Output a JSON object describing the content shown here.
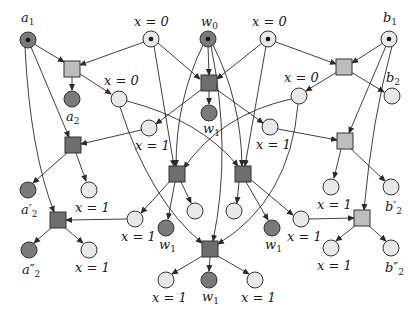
{
  "diagram": {
    "type": "petri-net",
    "colors": {
      "place_dark": "#7a7a7a",
      "place_light": "#e8e8e8",
      "trans_dark": "#6e6e6e",
      "trans_light": "#bdbdbd",
      "token": "#111111",
      "edge": "#2a2a2a"
    },
    "places": [
      {
        "id": "p_a1",
        "x": 28,
        "y": 40,
        "fill": "dark",
        "token": true,
        "label": "a",
        "sub": "1",
        "lx": 21,
        "ly": 22
      },
      {
        "id": "p_x0_top_l",
        "x": 151,
        "y": 39,
        "fill": "light",
        "token": true,
        "label": "x = 0",
        "sub": "",
        "lx": 134,
        "ly": 26
      },
      {
        "id": "p_w0",
        "x": 208,
        "y": 39,
        "fill": "dark",
        "token": true,
        "label": "w",
        "sub": "0",
        "lx": 201,
        "ly": 26
      },
      {
        "id": "p_x0_top_r",
        "x": 268,
        "y": 39,
        "fill": "light",
        "token": true,
        "label": "x = 0",
        "sub": "",
        "lx": 252,
        "ly": 26
      },
      {
        "id": "p_b1",
        "x": 389,
        "y": 39,
        "fill": "light",
        "token": true,
        "label": "b",
        "sub": "1",
        "lx": 383,
        "ly": 22
      },
      {
        "id": "p_a2",
        "x": 72,
        "y": 99,
        "fill": "dark",
        "token": false,
        "label": "a",
        "sub": "2",
        "lx": 66,
        "ly": 121
      },
      {
        "id": "p_x0_mid_l",
        "x": 119,
        "y": 99,
        "fill": "light",
        "token": false,
        "label": "x = 0",
        "sub": "",
        "lx": 104,
        "ly": 85
      },
      {
        "id": "p_w1_top",
        "x": 209,
        "y": 113,
        "fill": "dark",
        "token": false,
        "label": "w",
        "sub": "1",
        "lx": 203,
        "ly": 133
      },
      {
        "id": "p_x0_mid_r",
        "x": 299,
        "y": 96,
        "fill": "light",
        "token": false,
        "label": "x = 0",
        "sub": "",
        "lx": 284,
        "ly": 82
      },
      {
        "id": "p_b2",
        "x": 392,
        "y": 96,
        "fill": "light",
        "token": false,
        "label": "b",
        "sub": "2",
        "lx": 386,
        "ly": 82
      },
      {
        "id": "p_x1_l1",
        "x": 149,
        "y": 128,
        "fill": "light",
        "token": false,
        "label": "x = 1",
        "sub": "",
        "lx": 135,
        "ly": 150
      },
      {
        "id": "p_x1_r1",
        "x": 270,
        "y": 127,
        "fill": "light",
        "token": false,
        "label": "x = 1",
        "sub": "",
        "lx": 256,
        "ly": 149
      },
      {
        "id": "p_a2p",
        "x": 28,
        "y": 190,
        "fill": "dark",
        "token": false,
        "label": "a′",
        "sub": "2",
        "lx": 21,
        "ly": 214
      },
      {
        "id": "p_x1_l2",
        "x": 89,
        "y": 190,
        "fill": "light",
        "token": false,
        "label": "x = 1",
        "sub": "",
        "lx": 75,
        "ly": 212
      },
      {
        "id": "p_x1_r2",
        "x": 331,
        "y": 187,
        "fill": "light",
        "token": false,
        "label": "x = 1",
        "sub": "",
        "lx": 317,
        "ly": 209
      },
      {
        "id": "p_b2p",
        "x": 391,
        "y": 187,
        "fill": "light",
        "token": false,
        "label": "b′",
        "sub": "2",
        "lx": 385,
        "ly": 211
      },
      {
        "id": "p_x1_l3",
        "x": 135,
        "y": 219,
        "fill": "light",
        "token": false,
        "label": "x = 1",
        "sub": "",
        "lx": 121,
        "ly": 241
      },
      {
        "id": "p_w1_l",
        "x": 166,
        "y": 228,
        "fill": "dark",
        "token": false,
        "label": "w",
        "sub": "1",
        "lx": 159,
        "ly": 249
      },
      {
        "id": "p_c_l",
        "x": 195,
        "y": 211,
        "fill": "light",
        "token": false,
        "label": "",
        "sub": ""
      },
      {
        "id": "p_c_r",
        "x": 234,
        "y": 211,
        "fill": "light",
        "token": false,
        "label": "",
        "sub": ""
      },
      {
        "id": "p_w1_r",
        "x": 272,
        "y": 228,
        "fill": "dark",
        "token": false,
        "label": "w",
        "sub": "1",
        "lx": 265,
        "ly": 249
      },
      {
        "id": "p_x1_r3",
        "x": 301,
        "y": 219,
        "fill": "light",
        "token": false,
        "label": "x = 1",
        "sub": "",
        "lx": 287,
        "ly": 241
      },
      {
        "id": "p_a2pp",
        "x": 29,
        "y": 250,
        "fill": "dark",
        "token": false,
        "label": "a″",
        "sub": "2",
        "lx": 22,
        "ly": 274
      },
      {
        "id": "p_x1_l4",
        "x": 89,
        "y": 250,
        "fill": "light",
        "token": false,
        "label": "x = 1",
        "sub": "",
        "lx": 75,
        "ly": 272
      },
      {
        "id": "p_x1_r4",
        "x": 331,
        "y": 248,
        "fill": "light",
        "token": false,
        "label": "x = 1",
        "sub": "",
        "lx": 317,
        "ly": 270
      },
      {
        "id": "p_b2pp",
        "x": 391,
        "y": 248,
        "fill": "light",
        "token": false,
        "label": "b″",
        "sub": "2",
        "lx": 385,
        "ly": 272
      },
      {
        "id": "p_x1_b_l",
        "x": 166,
        "y": 280,
        "fill": "light",
        "token": false,
        "label": "x = 1",
        "sub": "",
        "lx": 152,
        "ly": 302
      },
      {
        "id": "p_w1_b",
        "x": 209,
        "y": 280,
        "fill": "dark",
        "token": false,
        "label": "w",
        "sub": "1",
        "lx": 202,
        "ly": 301
      },
      {
        "id": "p_x1_b_r",
        "x": 255,
        "y": 280,
        "fill": "light",
        "token": false,
        "label": "x = 1",
        "sub": "",
        "lx": 241,
        "ly": 302
      }
    ],
    "transitions": [
      {
        "id": "t1",
        "x": 72,
        "y": 69,
        "fill": "light"
      },
      {
        "id": "t2",
        "x": 209,
        "y": 83,
        "fill": "dark"
      },
      {
        "id": "t3",
        "x": 344,
        "y": 67,
        "fill": "light"
      },
      {
        "id": "t4",
        "x": 73,
        "y": 145,
        "fill": "dark"
      },
      {
        "id": "t5",
        "x": 177,
        "y": 174,
        "fill": "dark"
      },
      {
        "id": "t6",
        "x": 243,
        "y": 174,
        "fill": "dark"
      },
      {
        "id": "t7",
        "x": 345,
        "y": 141,
        "fill": "light"
      },
      {
        "id": "t8",
        "x": 58,
        "y": 220,
        "fill": "dark"
      },
      {
        "id": "t9",
        "x": 362,
        "y": 218,
        "fill": "light"
      },
      {
        "id": "t10",
        "x": 210,
        "y": 249,
        "fill": "dark"
      }
    ],
    "arcs": [
      {
        "d": "M34,44 L64,62"
      },
      {
        "d": "M144,42 L80,65"
      },
      {
        "d": "M72,76 L72,90"
      },
      {
        "d": "M80,74 L111,94"
      },
      {
        "d": "M158,43 L200,79"
      },
      {
        "d": "M208,46 L209,75"
      },
      {
        "d": "M262,43 L217,79"
      },
      {
        "d": "M209,91 L209,104"
      },
      {
        "d": "M202,89 L156,124"
      },
      {
        "d": "M216,89 L263,123"
      },
      {
        "d": "M276,42 L336,64"
      },
      {
        "d": "M383,43 L352,63"
      },
      {
        "d": "M337,72 L306,91"
      },
      {
        "d": "M351,72 L384,92"
      },
      {
        "d": "M31,47 L69,137"
      },
      {
        "d": "M141,130 L81,144"
      },
      {
        "d": "M68,152 L33,183"
      },
      {
        "d": "M76,153 L86,181"
      },
      {
        "d": "M386,46 L349,133"
      },
      {
        "d": "M278,129 L337,140"
      },
      {
        "d": "M341,149 L334,178"
      },
      {
        "d": "M350,148 L385,181"
      },
      {
        "d": "M154,46 L174,166"
      },
      {
        "d": "M203,45 Q176,100 176,166"
      },
      {
        "d": "M291,99 Q220,115 184,168"
      },
      {
        "d": "M127,101 Q200,120 238,166"
      },
      {
        "d": "M213,45 Q241,100 242,166"
      },
      {
        "d": "M266,46 L245,166"
      },
      {
        "d": "M171,180 L141,213"
      },
      {
        "d": "M175,182 L168,219"
      },
      {
        "d": "M181,182 L191,203"
      },
      {
        "d": "M239,182 L237,203"
      },
      {
        "d": "M246,182 L268,220"
      },
      {
        "d": "M250,179 L293,215"
      },
      {
        "d": "M127,219 L66,220"
      },
      {
        "d": "M25,47 Q30,150 54,212"
      },
      {
        "d": "M52,227 L34,243"
      },
      {
        "d": "M64,227 L83,243"
      },
      {
        "d": "M309,219 L354,218"
      },
      {
        "d": "M392,46 Q372,120 364,210"
      },
      {
        "d": "M356,225 L336,241"
      },
      {
        "d": "M368,225 L386,241"
      },
      {
        "d": "M120,107 Q150,200 202,243"
      },
      {
        "d": "M211,46 Q232,150 213,241"
      },
      {
        "d": "M298,104 Q290,200 218,244"
      },
      {
        "d": "M204,255 L172,274"
      },
      {
        "d": "M210,257 L209,271"
      },
      {
        "d": "M216,255 L249,274"
      }
    ]
  }
}
